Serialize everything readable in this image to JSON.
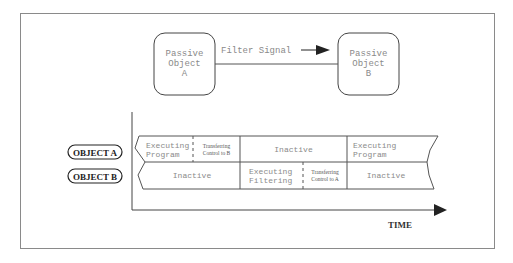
{
  "diagram": {
    "passive_objects": [
      {
        "line1": "Passive",
        "line2": "Object",
        "line3": "A"
      },
      {
        "line1": "Passive",
        "line2": "Object",
        "line3": "B"
      }
    ],
    "signal_label": "Filter Signal",
    "rows": [
      {
        "label": "OBJECT A",
        "segments": [
          {
            "line1": "Executing",
            "line2": "Program"
          },
          {
            "line1": "Transferring",
            "line2": "Control to B"
          },
          {
            "line1": "Inactive",
            "line2": ""
          },
          {
            "line1": "Executing",
            "line2": "Program"
          }
        ]
      },
      {
        "label": "OBJECT B",
        "segments": [
          {
            "line1": "Inactive",
            "line2": ""
          },
          {
            "line1": "Executing",
            "line2": "Filtering"
          },
          {
            "line1": "Transferring",
            "line2": "Control to A"
          },
          {
            "line1": "Inactive",
            "line2": ""
          }
        ]
      }
    ],
    "axis_label": "TIME",
    "colors": {
      "frame": "#8a8a8a",
      "line": "#555555",
      "text_gray": "#8a8a8a",
      "text_dark": "#222222"
    }
  }
}
